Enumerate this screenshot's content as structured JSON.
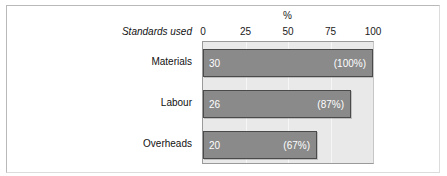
{
  "figure": {
    "background_color": "#ffffff",
    "frame_color": "#b9b9b9"
  },
  "chart_data": {
    "type": "bar",
    "orientation": "horizontal",
    "title": "",
    "xlabel": "%",
    "ylabel": "Standards used",
    "categories": [
      "Materials",
      "Labour",
      "Overheads"
    ],
    "values": [
      30,
      26,
      20
    ],
    "percent_values": [
      100,
      87,
      67
    ],
    "value_labels": [
      "30",
      "26",
      "20"
    ],
    "percent_labels": [
      "(100%)",
      "(87%)",
      "(67%)"
    ],
    "xlim": [
      0,
      100
    ],
    "xticks": [
      0,
      25,
      50,
      75,
      100
    ],
    "xtick_labels": [
      "0",
      "25",
      "50",
      "75",
      "100"
    ],
    "grid": true,
    "grid_axis": "x",
    "legend": false,
    "bar_color": "#8a8a8a",
    "bar_edge_color": "#4a4a4a",
    "bar_label_color": "#ffffff",
    "plot_background_color": "#e9e9e9",
    "gridline_color": "#f6f6f6"
  }
}
